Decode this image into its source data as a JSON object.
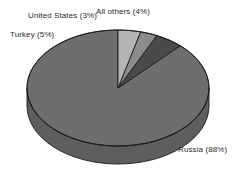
{
  "chart_data": {
    "type": "pie",
    "title": "",
    "subtitle": "",
    "xlabel": "",
    "ylabel": "",
    "grid": false,
    "legend_position": "none",
    "label_format": "name (percent%)",
    "style": "3d-grayscale",
    "background_color": "#ffffff",
    "outline_color": "#1c1c1c",
    "categories": [
      "Russia",
      "Turkey",
      "United States",
      "All others"
    ],
    "values": [
      88,
      5,
      3,
      4
    ],
    "unit": "%",
    "total": 100,
    "slices": [
      {
        "name": "Russia",
        "value": 88,
        "label": "Russia (88%)",
        "color": "#6e6e6e",
        "side_color": "#5e5e5e"
      },
      {
        "name": "Turkey",
        "value": 5,
        "label": "Turkey (5%)",
        "color": "#4a4a4a",
        "side_color": "#3e3e3e"
      },
      {
        "name": "United States",
        "value": 3,
        "label": "United States (3%)",
        "color": "#8c8c8c",
        "side_color": "#7a7a7a"
      },
      {
        "name": "All others",
        "value": 4,
        "label": "All others (4%)",
        "color": "#b5b5b5",
        "side_color": "#9f9f9f"
      }
    ]
  },
  "labels": {
    "russia": "Russia (88%)",
    "turkey": "Turkey (5%)",
    "united_states": "United States (3%)",
    "all_others": "All others (4%)"
  }
}
